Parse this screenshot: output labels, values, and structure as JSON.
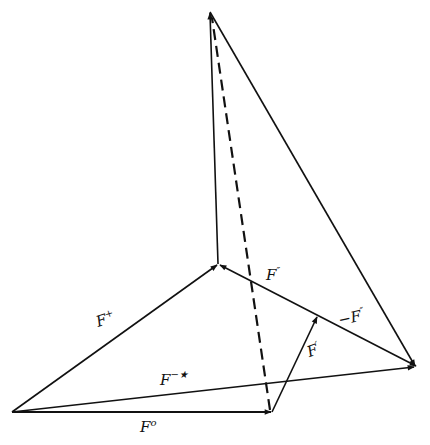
{
  "figure": {
    "stroke_color": "#111111",
    "background": "#ffffff",
    "points": {
      "origin": [
        12,
        412
      ],
      "f_zero_tip": [
        272,
        412
      ],
      "f_plus_tip": [
        218,
        264
      ],
      "apex": [
        210,
        12
      ],
      "right": [
        416,
        367
      ],
      "f_prime_tip": [
        317,
        316
      ]
    },
    "vectors": [
      {
        "id": "F0",
        "from": "origin",
        "to": "f_zero_tip",
        "style": "solid",
        "arrow": true
      },
      {
        "id": "Fplus",
        "from": "origin",
        "to": "f_plus_tip",
        "style": "solid",
        "arrow": true
      },
      {
        "id": "Fminusstar",
        "from": "origin",
        "to": "right",
        "style": "solid",
        "arrow": true
      },
      {
        "id": "Fprime",
        "from": "f_zero_tip",
        "to": "f_prime_tip",
        "style": "solid",
        "arrow": true
      },
      {
        "id": "Fdoubleprime",
        "from": "right",
        "to": "f_plus_tip",
        "style": "solid",
        "arrow": true
      },
      {
        "id": "vertical",
        "from": "f_plus_tip",
        "to": "apex",
        "style": "solid",
        "arrow": true
      },
      {
        "id": "slant",
        "from": "apex",
        "to": "right",
        "style": "solid",
        "arrow": true
      },
      {
        "id": "dashed",
        "from": "f_zero_tip",
        "to": "apex",
        "style": "dashed",
        "arrow": false
      }
    ],
    "labels": {
      "f_zero": {
        "base": "F",
        "sup": "o"
      },
      "f_plus": {
        "base": "F",
        "sup": "+"
      },
      "f_minus_star": {
        "base": "F",
        "sup": "−★"
      },
      "f_prime": {
        "base": "F",
        "sup": "′"
      },
      "f_double_prime": {
        "base": "F",
        "sup": "″"
      },
      "neg_f_double_prime": {
        "base": "−F",
        "sup": "″"
      }
    }
  }
}
